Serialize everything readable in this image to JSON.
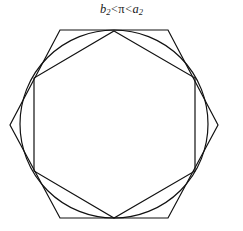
{
  "figure": {
    "caption": {
      "full_text": "b2<π<a2",
      "left_symbol": "b",
      "left_subscript": "2",
      "first_operator": "<",
      "middle_symbol": "π",
      "second_operator": "<",
      "right_symbol": "a",
      "right_subscript": "2"
    },
    "background_color": "#ffffff",
    "stroke_color": "#111111",
    "shapes": {
      "circumscribed_hexagon": {
        "label": "circumscribed-hexagon",
        "orientation": "flat-top",
        "stroke_width": 1.2,
        "points": "60,30 168,30 218,125 168,218 60,218 10,125"
      },
      "circle": {
        "label": "circle",
        "stroke_width": 1.2,
        "cx": 114,
        "cy": 124,
        "r": 94
      },
      "inscribed_hexagon": {
        "label": "inscribed-hexagon",
        "orientation": "pointy-top",
        "stroke_width": 1.2,
        "points": "114,31 195,78 195,171 114,218 34,171 34,78"
      }
    }
  }
}
